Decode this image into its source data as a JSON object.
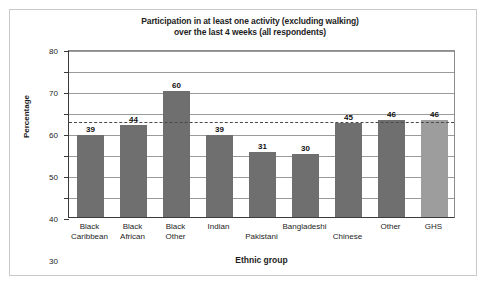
{
  "chart_data": {
    "type": "bar",
    "title": "Participation in at least one activity (excluding walking) over the last 4 weeks (all respondents)",
    "title_line1": "Participation in at least one activity (excluding walking)",
    "title_line2": "over the last 4 weeks (all respondents)",
    "xlabel": "Ethnic group",
    "ylabel": "Percentage",
    "categories": [
      "Black Caribbean",
      "Black African",
      "Black Other",
      "Indian",
      "Pakistani",
      "Bangladeshi",
      "Chinese",
      "Other",
      "GHS"
    ],
    "category_lines": [
      [
        "Black",
        "Caribbean"
      ],
      [
        "Black",
        "African"
      ],
      [
        "Black",
        "Other"
      ],
      [
        "Indian",
        ""
      ],
      [
        "",
        "Pakistani"
      ],
      [
        "Bangladeshi",
        ""
      ],
      [
        "",
        "Chinese"
      ],
      [
        "Other",
        ""
      ],
      [
        "GHS",
        ""
      ]
    ],
    "values": [
      39,
      44,
      60,
      39,
      31,
      30,
      45,
      46,
      46
    ],
    "ylim": [
      0,
      80
    ],
    "yticks": [
      0,
      10,
      20,
      30,
      40,
      50,
      60,
      70,
      80
    ],
    "ytick_labels": [
      "0",
      "10",
      "20",
      "30",
      "40",
      "50",
      "60",
      "70",
      "80"
    ],
    "grid": true,
    "legend": "none",
    "reference_line": {
      "value": 46,
      "style": "dashed",
      "label": "GHS benchmark"
    },
    "bar_colors": [
      "#706f6f",
      "#706f6f",
      "#706f6f",
      "#706f6f",
      "#706f6f",
      "#706f6f",
      "#706f6f",
      "#706f6f",
      "#9d9d9d"
    ],
    "colors": {
      "bar_primary": "#706f6f",
      "bar_highlight": "#9d9d9d",
      "axis": "#3b3b3b",
      "grid": "#9a9a9a",
      "text": "#1d1d1d",
      "frame": "#c9c9c9",
      "background": "#ffffff"
    }
  }
}
